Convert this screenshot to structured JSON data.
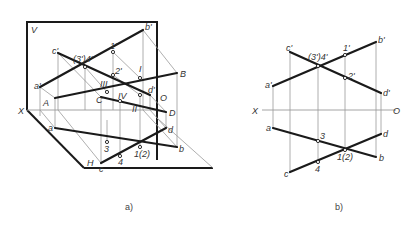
{
  "figure_a": {
    "caption": "a)",
    "plane_labels": {
      "V": "V",
      "H": "H",
      "X": "X"
    },
    "space_points": {
      "A": "A",
      "B": "B",
      "C": "C",
      "D": "D"
    },
    "roman_points": {
      "I": "I",
      "II": "II",
      "III": "III",
      "IV": "IV"
    },
    "front_labels": {
      "a": "a'",
      "b": "b'",
      "c": "c'",
      "d": "d'",
      "p34": "(3')4'",
      "p1": "1'",
      "p2": "2'"
    },
    "top_labels": {
      "a": "a",
      "b": "b",
      "c": "c",
      "d": "d",
      "p3": "3",
      "p4": "4",
      "p12": "1(2)"
    },
    "origin": "O"
  },
  "figure_b": {
    "caption": "b)",
    "axis": {
      "X": "X",
      "O": "O"
    },
    "front_labels": {
      "a": "a'",
      "b": "b'",
      "c": "c'",
      "d": "d'",
      "p34": "(3')4'",
      "p1": "1'",
      "p2": "2'"
    },
    "top_labels": {
      "a": "a",
      "b": "b",
      "c": "c",
      "d": "d",
      "p3": "3",
      "p4": "4",
      "p12": "1(2)"
    }
  }
}
